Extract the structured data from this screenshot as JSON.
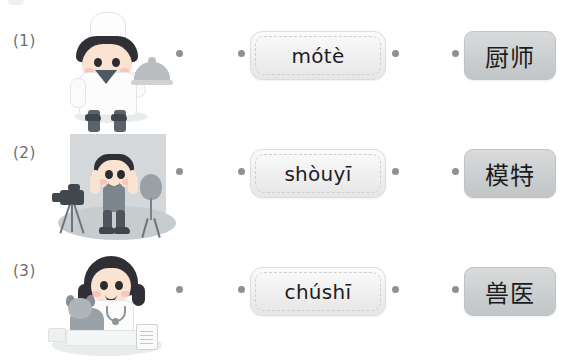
{
  "worksheet": {
    "type": "matching-exercise",
    "rows": [
      {
        "number": "(1)",
        "illustration": "chef-illustration",
        "illustration_alt": "boy chef in white toque holding a covered serving dish",
        "pinyin": "mótè",
        "hanzi": "厨师"
      },
      {
        "number": "(2)",
        "illustration": "model-illustration",
        "illustration_alt": "boy model posing in photo studio with camera on tripod and studio light",
        "pinyin": "shòuyī",
        "hanzi": "模特"
      },
      {
        "number": "(3)",
        "illustration": "veterinarian-illustration",
        "illustration_alt": "girl veterinarian with stethoscope examining a dog on a table",
        "pinyin": "chúshī",
        "hanzi": "兽医"
      }
    ]
  },
  "colors": {
    "page_background": "#ffffff",
    "dot": "#8d9095",
    "label_text": "#6d6d6d",
    "pinyin_text": "#1d1d1f",
    "hanzi_text": "#1b1b1d",
    "hanzi_box_fill": "#cdd0d1",
    "pinyin_box_fill": "#f1f1f1",
    "studio_background": "#d4d8da"
  }
}
